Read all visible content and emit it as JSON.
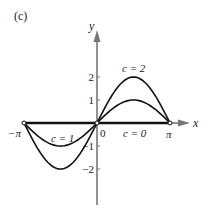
{
  "panel_label": "(c)",
  "axes": {
    "x_label": "x",
    "y_label": "y",
    "x_ticks": [
      {
        "label": "−π",
        "value": -3.14159
      },
      {
        "label": "0",
        "value": 0
      },
      {
        "label": "π",
        "value": 3.14159
      }
    ],
    "y_ticks": [
      {
        "label": "2",
        "value": 2
      },
      {
        "label": "1",
        "value": 1
      },
      {
        "label": "−1",
        "value": -1
      },
      {
        "label": "−2",
        "value": -2
      }
    ],
    "axis_color": "#777777"
  },
  "curves": [
    {
      "name": "c = 2",
      "c": 2,
      "function": "y = c sin x",
      "domain": [
        -3.14159,
        3.14159
      ]
    },
    {
      "name": "c = 1",
      "c": 1,
      "function": "y = c sin x",
      "domain": [
        -3.14159,
        3.14159
      ]
    },
    {
      "name": "c = 0",
      "c": 0,
      "function": "y = c sin x",
      "domain": [
        -3.14159,
        3.14159
      ]
    }
  ],
  "curve_labels": {
    "c2": "c = 2",
    "c1": "c = 1",
    "c0": "c = 0"
  },
  "curve_color": "#111111"
}
